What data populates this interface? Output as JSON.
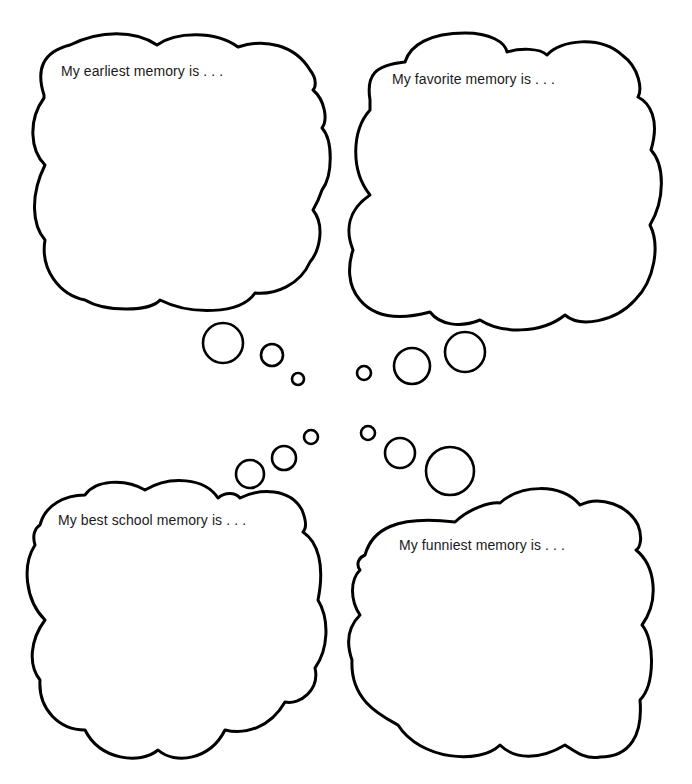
{
  "worksheet": {
    "clouds": [
      {
        "id": "earliest",
        "prompt": "My earliest memory is . . ."
      },
      {
        "id": "favorite",
        "prompt": "My favorite memory is . . ."
      },
      {
        "id": "best-school",
        "prompt": "My best school memory is . . ."
      },
      {
        "id": "funniest",
        "prompt": "My funniest memory is . . ."
      }
    ],
    "colors": {
      "line": "#000000",
      "background": "#ffffff",
      "text": "#1a1a1a"
    }
  }
}
